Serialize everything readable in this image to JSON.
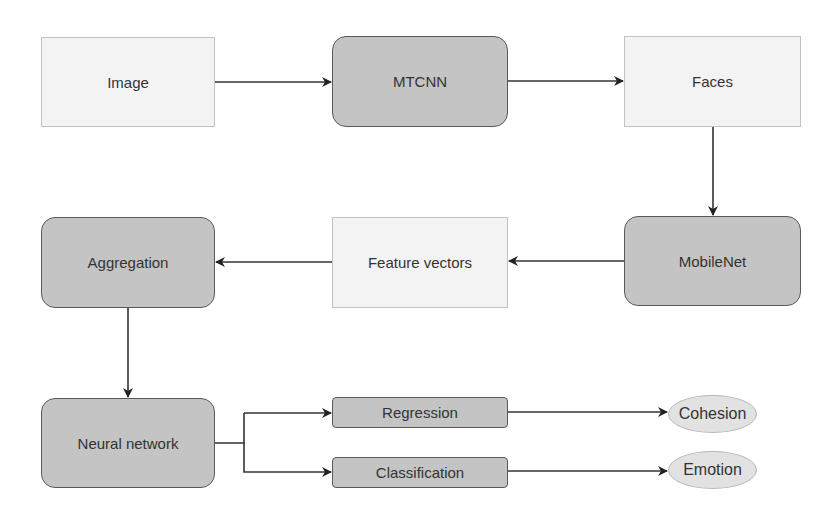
{
  "diagram": {
    "type": "flowchart",
    "nodes": {
      "image": "Image",
      "mtcnn": "MTCNN",
      "faces": "Faces",
      "mobilenet": "MobileNet",
      "feature_vectors": "Feature vectors",
      "aggregation": "Aggregation",
      "neural_network": "Neural network",
      "regression": "Regression",
      "classification": "Classification",
      "cohesion": "Cohesion",
      "emotion": "Emotion"
    },
    "edges": [
      [
        "Image",
        "MTCNN"
      ],
      [
        "MTCNN",
        "Faces"
      ],
      [
        "Faces",
        "MobileNet"
      ],
      [
        "MobileNet",
        "Feature vectors"
      ],
      [
        "Feature vectors",
        "Aggregation"
      ],
      [
        "Aggregation",
        "Neural network"
      ],
      [
        "Neural network",
        "Regression"
      ],
      [
        "Neural network",
        "Classification"
      ],
      [
        "Regression",
        "Cohesion"
      ],
      [
        "Classification",
        "Emotion"
      ]
    ],
    "colors": {
      "light_fill": "#f3f3f3",
      "dark_fill": "#c4c4c4",
      "stroke": "#333333"
    }
  }
}
